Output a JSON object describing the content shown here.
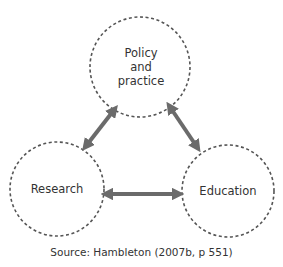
{
  "diagram": {
    "nodes": [
      {
        "id": "policy",
        "label": "Policy\nand\npractice",
        "cx": 140,
        "cy": 67,
        "r": 50
      },
      {
        "id": "research",
        "label": "Research",
        "cx": 57,
        "cy": 189,
        "r": 47
      },
      {
        "id": "education",
        "label": "Education",
        "cx": 228,
        "cy": 191,
        "r": 46
      }
    ],
    "edges": [
      {
        "from": "research",
        "to": "policy",
        "type": "bidirectional"
      },
      {
        "from": "policy",
        "to": "education",
        "type": "bidirectional"
      },
      {
        "from": "research",
        "to": "education",
        "type": "bidirectional"
      }
    ],
    "colors": {
      "circle_stroke": "#555555",
      "arrow": "#6b6b6b",
      "text": "#333333"
    }
  },
  "caption": "Source: Hambleton (2007b, p 551)"
}
